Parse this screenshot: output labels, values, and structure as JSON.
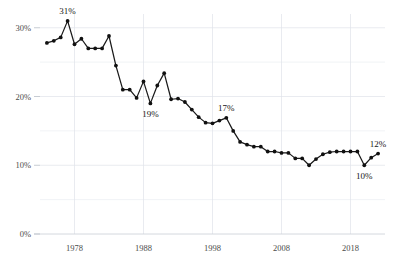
{
  "chart_data": {
    "type": "line",
    "title": "",
    "subtitle": "",
    "xlabel": "",
    "ylabel": "",
    "xlim": [
      1973,
      2023
    ],
    "ylim": [
      0,
      32
    ],
    "grid": true,
    "legend": "none",
    "y_ticks": [
      "0%",
      "10%",
      "20%",
      "30%"
    ],
    "y_tick_values": [
      0,
      10,
      20,
      30
    ],
    "y_minor_gridlines": [
      5,
      15,
      25
    ],
    "x_ticks": [
      "1978",
      "1988",
      "1998",
      "2008",
      "2018"
    ],
    "x_tick_values": [
      1978,
      1988,
      1998,
      2008,
      2018
    ],
    "series": [
      {
        "name": "series-1",
        "x": [
          1974,
          1975,
          1976,
          1977,
          1978,
          1979,
          1980,
          1981,
          1982,
          1983,
          1984,
          1985,
          1986,
          1987,
          1988,
          1989,
          1990,
          1991,
          1992,
          1993,
          1994,
          1995,
          1996,
          1997,
          1998,
          1999,
          2000,
          2001,
          2002,
          2003,
          2004,
          2005,
          2006,
          2007,
          2008,
          2009,
          2010,
          2011,
          2012,
          2013,
          2014,
          2015,
          2016,
          2017,
          2018,
          2019,
          2020,
          2021,
          2022
        ],
        "values": [
          27.8,
          28.1,
          28.6,
          31.0,
          27.6,
          28.4,
          27.0,
          27.0,
          27.0,
          28.8,
          24.5,
          21.0,
          21.0,
          19.8,
          22.2,
          19.0,
          21.6,
          23.4,
          19.6,
          19.7,
          19.2,
          18.1,
          17.0,
          16.2,
          16.1,
          16.5,
          16.9,
          15.0,
          13.4,
          13.0,
          12.7,
          12.7,
          12.0,
          12.0,
          11.8,
          11.8,
          11.0,
          11.0,
          10.0,
          10.9,
          11.6,
          11.9,
          12.0,
          12.0,
          12.0,
          12.0,
          10.0,
          11.1,
          11.7
        ]
      }
    ],
    "annotations": [
      {
        "label": "31%",
        "x": 1977,
        "y": 31.0,
        "position": "above"
      },
      {
        "label": "19%",
        "x": 1989,
        "y": 19.0,
        "position": "below"
      },
      {
        "label": "17%",
        "x": 2000,
        "y": 16.9,
        "position": "above"
      },
      {
        "label": "10%",
        "x": 2020,
        "y": 10.0,
        "position": "below"
      },
      {
        "label": "12%",
        "x": 2022,
        "y": 11.7,
        "position": "above"
      }
    ],
    "colors": {
      "line": "#1a1a1a",
      "marker": "#111111",
      "grid": "#dfe3ea",
      "axis": "#c9ced6",
      "tick_label": "#4a4a4a",
      "annotation": "#161616",
      "background": "#ffffff"
    }
  }
}
